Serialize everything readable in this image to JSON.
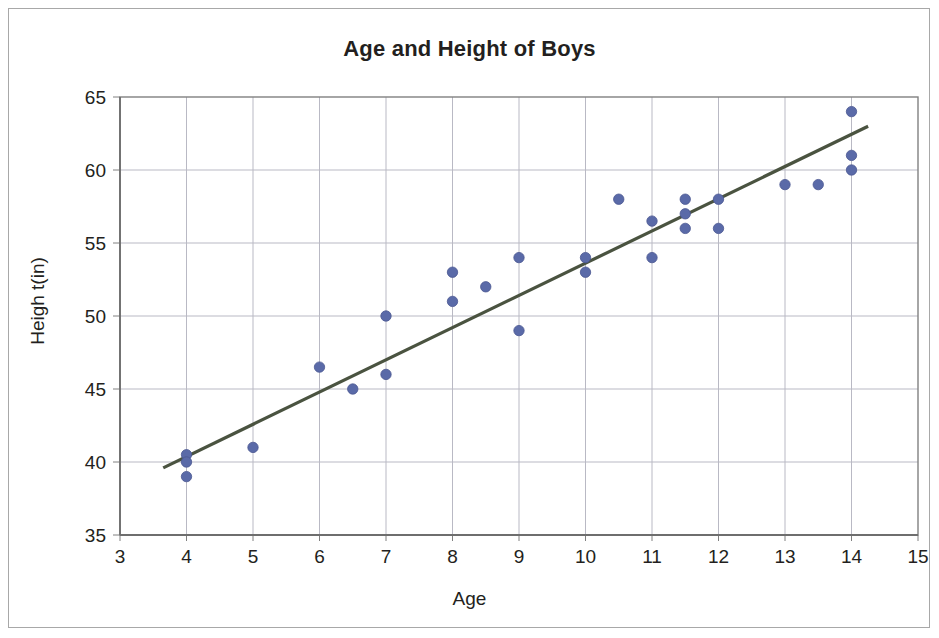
{
  "chart_data": {
    "type": "scatter",
    "title": "Age and Height of Boys",
    "xlabel": "Age",
    "ylabel": "Heigh t(in)",
    "xlim": [
      3,
      15
    ],
    "ylim": [
      35,
      65
    ],
    "xticks": [
      "3",
      "4",
      "5",
      "6",
      "7",
      "8",
      "9",
      "10",
      "11",
      "12",
      "13",
      "14",
      "15"
    ],
    "yticks": [
      "35",
      "40",
      "45",
      "50",
      "55",
      "60",
      "65"
    ],
    "grid": true,
    "legend": "none",
    "marker_color": "#5a6aa8",
    "trendline_color": "#4a5340",
    "axis_color": "#808080",
    "gridline_color": "#b9b9c4",
    "series": [
      {
        "name": "Age and Height of Boys",
        "marker": "circle",
        "points": [
          {
            "x": 4,
            "y": 40.5
          },
          {
            "x": 4,
            "y": 40
          },
          {
            "x": 4,
            "y": 39
          },
          {
            "x": 5,
            "y": 41
          },
          {
            "x": 6,
            "y": 46.5
          },
          {
            "x": 6.5,
            "y": 45
          },
          {
            "x": 7,
            "y": 46
          },
          {
            "x": 7,
            "y": 50
          },
          {
            "x": 8,
            "y": 53
          },
          {
            "x": 8,
            "y": 51
          },
          {
            "x": 8.5,
            "y": 52
          },
          {
            "x": 9,
            "y": 54
          },
          {
            "x": 9,
            "y": 49
          },
          {
            "x": 10,
            "y": 54
          },
          {
            "x": 10,
            "y": 53
          },
          {
            "x": 10.5,
            "y": 58
          },
          {
            "x": 11,
            "y": 56.5
          },
          {
            "x": 11,
            "y": 54
          },
          {
            "x": 11.5,
            "y": 58
          },
          {
            "x": 11.5,
            "y": 57
          },
          {
            "x": 11.5,
            "y": 56
          },
          {
            "x": 12,
            "y": 58
          },
          {
            "x": 12,
            "y": 56
          },
          {
            "x": 13,
            "y": 59
          },
          {
            "x": 13.5,
            "y": 59
          },
          {
            "x": 14,
            "y": 64
          },
          {
            "x": 14,
            "y": 61
          },
          {
            "x": 14,
            "y": 60
          }
        ]
      }
    ],
    "trendline": {
      "x_start": 3.65,
      "y_start": 39.6,
      "x_end": 14.25,
      "y_end": 63.0
    }
  }
}
